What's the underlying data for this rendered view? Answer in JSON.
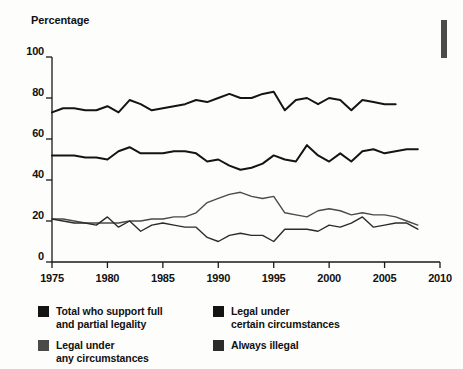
{
  "figure": {
    "axis_title": "Percentage",
    "corner_mark": "vertical-bar"
  },
  "axes": {
    "y": {
      "label": "Percentage",
      "ticks": [
        "0",
        "20",
        "40",
        "60",
        "80",
        "100"
      ],
      "min": 0,
      "max": 100
    },
    "x": {
      "ticks": [
        "1975",
        "1980",
        "1985",
        "1990",
        "1995",
        "2000",
        "2005",
        "2010"
      ],
      "min": 1975,
      "max": 2010
    }
  },
  "legend": {
    "items": [
      {
        "label": "Total who support full\nand partial legality",
        "color": "#141414"
      },
      {
        "label": "Legal under\ncertain circumstances",
        "color": "#141414"
      },
      {
        "label": "Legal under\nany circumstances",
        "color": "#4a4a4a"
      },
      {
        "label": "Always illegal",
        "color": "#2b2b2b"
      }
    ]
  },
  "chart_data": {
    "type": "line",
    "title": "",
    "xlabel": "",
    "ylabel": "Percentage",
    "xlim": [
      1975,
      2010
    ],
    "ylim": [
      0,
      100
    ],
    "grid": false,
    "legend_position": "bottom",
    "series": [
      {
        "name": "Total who support full and partial legality",
        "color": "#141414",
        "x": [
          1975,
          1976,
          1977,
          1978,
          1979,
          1980,
          1981,
          1982,
          1983,
          1984,
          1985,
          1986,
          1987,
          1988,
          1989,
          1990,
          1991,
          1992,
          1993,
          1994,
          1995,
          1996,
          1997,
          1998,
          1999,
          2000,
          2001,
          2002,
          2003,
          2004,
          2005,
          2006
        ],
        "y": [
          73,
          75,
          75,
          74,
          74,
          76,
          73,
          79,
          77,
          74,
          75,
          76,
          77,
          79,
          78,
          80,
          82,
          80,
          80,
          82,
          83,
          74,
          79,
          80,
          77,
          80,
          79,
          74,
          79,
          78,
          77,
          77
        ]
      },
      {
        "name": "Legal under certain circumstances",
        "color": "#141414",
        "x": [
          1975,
          1976,
          1977,
          1978,
          1979,
          1980,
          1981,
          1982,
          1983,
          1984,
          1985,
          1986,
          1987,
          1988,
          1989,
          1990,
          1991,
          1992,
          1993,
          1994,
          1995,
          1996,
          1997,
          1998,
          1999,
          2000,
          2001,
          2002,
          2003,
          2004,
          2005,
          2006,
          2007,
          2008
        ],
        "y": [
          52,
          52,
          52,
          51,
          51,
          50,
          54,
          56,
          53,
          53,
          53,
          54,
          54,
          53,
          49,
          50,
          47,
          45,
          46,
          48,
          52,
          50,
          49,
          57,
          52,
          49,
          53,
          49,
          54,
          55,
          53,
          54,
          55,
          55
        ]
      },
      {
        "name": "Legal under any circumstances",
        "color": "#4a4a4a",
        "x": [
          1975,
          1976,
          1977,
          1978,
          1979,
          1980,
          1981,
          1982,
          1983,
          1984,
          1985,
          1986,
          1987,
          1988,
          1989,
          1990,
          1991,
          1992,
          1993,
          1994,
          1995,
          1996,
          1997,
          1998,
          1999,
          2000,
          2001,
          2002,
          2003,
          2004,
          2005,
          2006,
          2007,
          2008
        ],
        "y": [
          21,
          21,
          20,
          19,
          19,
          19,
          19,
          20,
          20,
          21,
          21,
          22,
          22,
          24,
          29,
          31,
          33,
          34,
          32,
          31,
          32,
          24,
          23,
          22,
          25,
          26,
          25,
          23,
          24,
          23,
          23,
          22,
          20,
          18
        ]
      },
      {
        "name": "Always illegal",
        "color": "#2b2b2b",
        "x": [
          1975,
          1976,
          1977,
          1978,
          1979,
          1980,
          1981,
          1982,
          1983,
          1984,
          1985,
          1986,
          1987,
          1988,
          1989,
          1990,
          1991,
          1992,
          1993,
          1994,
          1995,
          1996,
          1997,
          1998,
          1999,
          2000,
          2001,
          2002,
          2003,
          2004,
          2005,
          2006,
          2007,
          2008
        ],
        "y": [
          21,
          20,
          19,
          19,
          18,
          22,
          17,
          20,
          15,
          18,
          19,
          18,
          17,
          17,
          12,
          10,
          13,
          14,
          13,
          13,
          10,
          16,
          16,
          16,
          15,
          18,
          17,
          19,
          22,
          17,
          18,
          19,
          19,
          16
        ]
      }
    ]
  }
}
